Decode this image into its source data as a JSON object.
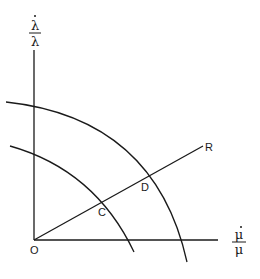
{
  "diagram": {
    "y_axis_label": {
      "numerator": "λ̇",
      "denominator": "λ",
      "num_char": "λ",
      "den_char": "λ"
    },
    "x_axis_label": {
      "numerator": "μ̇",
      "denominator": "μ",
      "num_char": "μ",
      "den_char": "μ"
    },
    "points": {
      "origin": "O",
      "inner_intersection": "C",
      "outer_intersection": "D",
      "ray_end": "R"
    },
    "colors": {
      "line": "#1a1a1a",
      "background": "#ffffff"
    }
  }
}
